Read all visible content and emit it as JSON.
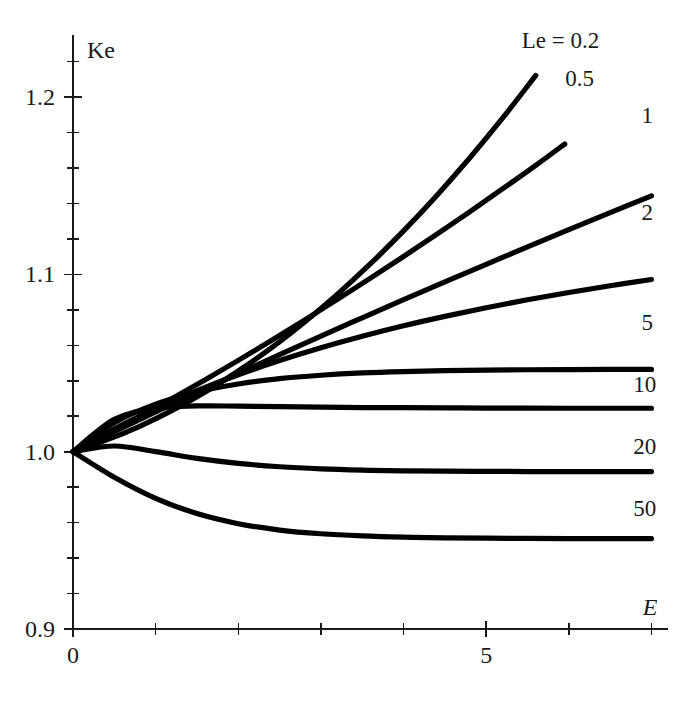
{
  "chart_data": {
    "type": "line",
    "title": "",
    "xlabel": "E",
    "ylabel": "Ke",
    "xlim": [
      0,
      7.2
    ],
    "ylim": [
      0.9,
      1.235
    ],
    "grid": false,
    "legend_position": "inline-right-of-curve-ends",
    "x_ticks_major": [
      {
        "value": 0,
        "label": "0"
      },
      {
        "value": 5,
        "label": "5"
      }
    ],
    "x_ticks_minor": [
      1,
      2,
      3,
      4,
      6,
      7
    ],
    "y_ticks_major": [
      {
        "value": 0.9,
        "label": "0.9"
      },
      {
        "value": 1.0,
        "label": "1.0"
      },
      {
        "value": 1.1,
        "label": "1.1"
      },
      {
        "value": 1.2,
        "label": "1.2"
      }
    ],
    "y_ticks_minor": [
      0.92,
      0.94,
      0.96,
      0.98,
      1.02,
      1.04,
      1.06,
      1.08,
      1.12,
      1.14,
      1.16,
      1.18,
      1.22
    ],
    "legend_title": "Le = 0.2",
    "series": [
      {
        "name": "Le = 0.2",
        "label": "Le = 0.2",
        "label_x": 5.9,
        "label_y": 1.2275,
        "x": [
          0,
          0.4,
          0.8,
          1.2,
          1.6,
          2.0,
          2.4,
          2.8,
          3.2,
          3.6,
          4.0,
          4.4,
          4.8,
          5.2,
          5.6
        ],
        "y": [
          1.0,
          1.0065,
          1.0142,
          1.0233,
          1.0337,
          1.0455,
          1.0585,
          1.073,
          1.0888,
          1.106,
          1.1245,
          1.1444,
          1.1656,
          1.1882,
          1.2122
        ]
      },
      {
        "name": "Le = 0.5",
        "label": "0.5",
        "label_x": 6.13,
        "label_y": 1.206,
        "x": [
          0,
          0.4,
          0.8,
          1.2,
          1.6,
          2.0,
          2.4,
          2.8,
          3.2,
          3.6,
          4.0,
          4.4,
          4.8,
          5.2,
          5.6,
          5.95
        ],
        "y": [
          1.0,
          1.0096,
          1.0196,
          1.03,
          1.0406,
          1.0515,
          1.0627,
          1.0742,
          1.0859,
          1.0979,
          1.1101,
          1.1226,
          1.1353,
          1.1483,
          1.1615,
          1.1735
        ]
      },
      {
        "name": "Le = 1",
        "label": "1",
        "label_x": 6.95,
        "label_y": 1.1855,
        "x": [
          0,
          0.5,
          1.0,
          1.5,
          2.0,
          2.5,
          3.0,
          3.5,
          4.0,
          4.5,
          5.0,
          5.5,
          6.0,
          6.5,
          7.0
        ],
        "y": [
          1.0,
          1.0113,
          1.0224,
          1.0333,
          1.0441,
          1.0547,
          1.0652,
          1.0755,
          1.0857,
          1.0958,
          1.1057,
          1.1155,
          1.1252,
          1.1348,
          1.1443
        ]
      },
      {
        "name": "Le = 2",
        "label": "2",
        "label_x": 6.95,
        "label_y": 1.1305,
        "x": [
          0,
          0.5,
          1.0,
          1.5,
          2.0,
          2.5,
          3.0,
          3.5,
          4.0,
          4.5,
          5.0,
          5.5,
          6.0,
          6.5,
          7.0
        ],
        "y": [
          1.0,
          1.0129,
          1.0243,
          1.0344,
          1.0434,
          1.0514,
          1.0586,
          1.0651,
          1.071,
          1.0763,
          1.0812,
          1.0857,
          1.0898,
          1.0936,
          1.0971
        ]
      },
      {
        "name": "Le = 5",
        "label": "5",
        "label_x": 6.95,
        "label_y": 1.0685,
        "x": [
          0,
          0.5,
          1.0,
          1.5,
          2.0,
          2.5,
          3.0,
          3.5,
          4.0,
          4.5,
          5.0,
          5.5,
          6.0,
          6.5,
          7.0
        ],
        "y": [
          1.0,
          1.0163,
          1.0268,
          1.0337,
          1.0382,
          1.0412,
          1.0431,
          1.0444,
          1.0452,
          1.0457,
          1.046,
          1.0462,
          1.0463,
          1.0464,
          1.0464
        ]
      },
      {
        "name": "Le = 10",
        "label": "10",
        "label_x": 6.92,
        "label_y": 1.0335,
        "x": [
          0,
          0.5,
          1.0,
          1.5,
          2.0,
          2.5,
          3.0,
          3.5,
          4.0,
          4.5,
          5.0,
          5.5,
          6.0,
          6.5,
          7.0
        ],
        "y": [
          1.0,
          1.0182,
          1.0245,
          1.0258,
          1.0257,
          1.0254,
          1.0251,
          1.0249,
          1.0248,
          1.0247,
          1.0246,
          1.0246,
          1.0245,
          1.0245,
          1.0245
        ]
      },
      {
        "name": "Le = 20",
        "label": "20",
        "label_x": 6.92,
        "label_y": 0.9985,
        "x": [
          0,
          0.5,
          1.0,
          1.5,
          2.0,
          2.5,
          3.0,
          3.5,
          4.0,
          4.5,
          5.0,
          5.5,
          6.0,
          6.5,
          7.0
        ],
        "y": [
          1.0,
          1.0032,
          1.0,
          0.9962,
          0.9934,
          0.9915,
          0.9903,
          0.9896,
          0.9892,
          0.989,
          0.9889,
          0.9888,
          0.9888,
          0.9888,
          0.9888
        ]
      },
      {
        "name": "Le = 50",
        "label": "50",
        "label_x": 6.92,
        "label_y": 0.9635,
        "x": [
          0,
          0.5,
          1.0,
          1.5,
          2.0,
          2.5,
          3.0,
          3.5,
          4.0,
          4.5,
          5.0,
          5.5,
          6.0,
          6.5,
          7.0
        ],
        "y": [
          1.0,
          0.9856,
          0.9737,
          0.9651,
          0.9594,
          0.9558,
          0.9537,
          0.9525,
          0.9518,
          0.9514,
          0.9512,
          0.9511,
          0.951,
          0.951,
          0.951
        ]
      }
    ]
  },
  "axis": {
    "y_title": "Ke",
    "x_title": "E"
  },
  "colors": {
    "curve": "#000000",
    "axis": "#1a1a1a",
    "background": "#ffffff"
  }
}
